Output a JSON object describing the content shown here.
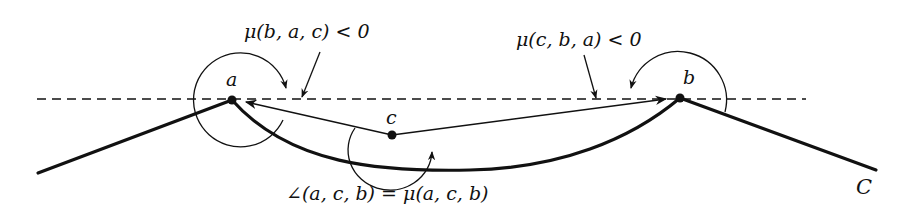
{
  "diagram": {
    "points": {
      "a": {
        "label": "a",
        "x": 232,
        "y": 100
      },
      "b": {
        "label": "b",
        "x": 680,
        "y": 98
      },
      "c": {
        "label": "c",
        "x": 392,
        "y": 135
      }
    },
    "curve_label": "C",
    "annotations": {
      "mu_bac": "μ(b, a, c) < 0",
      "mu_cba": "μ(c, b, a) < 0",
      "angle_acb": "∠(a, c, b) = μ(a, c, b)"
    },
    "colors": {
      "stroke": "#111111",
      "background": "#ffffff"
    }
  }
}
